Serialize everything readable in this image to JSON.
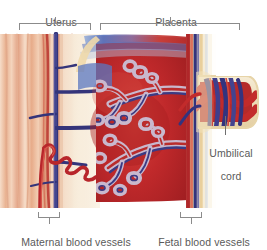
{
  "figure": {
    "type": "anatomical-diagram",
    "background_color": "#ffffff",
    "label_color": "#5a5a5a",
    "bracket_color": "#8b8b8b"
  },
  "labels": {
    "uterus": "Uterus",
    "placenta": "Placenta",
    "umbilical_cord_line1": "Umbilical",
    "umbilical_cord_line2": "cord",
    "maternal_blood_vessels": "Maternal blood vessels",
    "fetal_blood_vessels": "Fetal blood vessels"
  },
  "brackets": {
    "uterus": {
      "x": 19,
      "y": 22,
      "width": 72,
      "height": 7
    },
    "placenta": {
      "x": 100,
      "y": 22,
      "width": 140,
      "height": 7
    },
    "maternal": {
      "x": 38,
      "y": 214,
      "width": 22,
      "height": 6
    },
    "fetal": {
      "x": 180,
      "y": 214,
      "width": 22,
      "height": 6
    }
  },
  "colors": {
    "myometrium_light": "#f3cdb4",
    "myometrium_mid": "#e8ad8d",
    "myometrium_dark": "#d98f6a",
    "decidua": "#f6ead8",
    "intervillous_blood": "#c8302c",
    "intervillous_blood_deep": "#9e1f20",
    "maternal_artery": "#c0282b",
    "maternal_vein": "#3a3a7a",
    "fetal_artery": "#c0282b",
    "fetal_vein": "#3c3c82",
    "chorionic_plate": "#efd9a8",
    "amnion": "#f7f0de",
    "villus_stroma": "#d8c6d8",
    "top_gradient_blue": "#5b77c0",
    "top_gradient_red": "#c8302c"
  },
  "structures": [
    {
      "name": "myometrium",
      "region": "uterus wall",
      "description": "vertical fibrous muscle striations"
    },
    {
      "name": "decidua-basalis",
      "region": "uterus/placenta junction",
      "description": "pale cream band"
    },
    {
      "name": "spiral-artery",
      "region": "uterus",
      "description": "coiled red maternal artery entering intervillous space"
    },
    {
      "name": "uterine-vein",
      "region": "uterus",
      "description": "dark blue branching maternal vein"
    },
    {
      "name": "intervillous-space",
      "region": "placenta",
      "description": "red pool of maternal blood"
    },
    {
      "name": "chorionic-villus-tree",
      "region": "placenta",
      "description": "branching villous tree with fetal capillaries"
    },
    {
      "name": "chorionic-plate",
      "region": "placenta",
      "description": "vertical band with fetal vessels"
    },
    {
      "name": "umbilical-cord",
      "region": "fetal side",
      "description": "helical red artery and blue vein"
    }
  ],
  "leaders": {
    "uterus_stem": {
      "x": 55,
      "y": 16,
      "height": 7
    },
    "placenta_stem": {
      "x": 170,
      "y": 16,
      "height": 7
    },
    "maternal_stem": {
      "x": 49,
      "y": 220,
      "height": 6
    },
    "fetal_stem": {
      "x": 191,
      "y": 220,
      "height": 6
    },
    "cord_leader": {
      "x": 225,
      "y": 116,
      "height": 20
    }
  }
}
